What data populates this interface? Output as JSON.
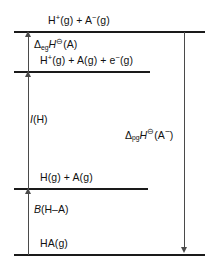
{
  "diagram": {
    "levels": [
      {
        "id": "ion-pair",
        "label_html": "H<sup>+</sup>(g) + A<sup>−</sup>(g)",
        "label_text": "H+(g) + A-(g)"
      },
      {
        "id": "proton-atom-electron",
        "label_html": "H<sup>+</sup>(g) + A(g) + e<sup>−</sup>(g)",
        "label_text": "H+(g) + A(g) + e-(g)"
      },
      {
        "id": "atoms",
        "label_html": "H(g) + A(g)",
        "label_text": "H(g) + A(g)"
      },
      {
        "id": "molecule",
        "label_html": "HA(g)",
        "label_text": "HA(g)"
      }
    ],
    "quantities": [
      {
        "id": "electron-gain-enthalpy",
        "label_html": "<span class=\"delta\">Δ</span><span class=\"sub\">eg</span><span class=\"ital\">H</span><span class=\"sup\">⊖</span>(A)",
        "label_text": "ΔegH⊖(A)",
        "direction": "up"
      },
      {
        "id": "ionisation-enthalpy",
        "label_html": "<span class=\"ital\">I</span>(H)",
        "label_text": "I(H)",
        "direction": "up"
      },
      {
        "id": "bond-enthalpy",
        "label_html": "<span class=\"ital\">B</span>(H–A)",
        "label_text": "B(H–A)",
        "direction": "up"
      },
      {
        "id": "proton-gain-enthalpy",
        "label_html": "<span class=\"delta\">Δ</span><span class=\"sub\">pg</span><span class=\"ital\">H</span><span class=\"sup\">⊖</span>(A<sup>−</sup>)",
        "label_text": "ΔpgH⊖(A−)",
        "direction": "down"
      }
    ],
    "colors": {
      "level_line": "#1a1a1a",
      "arrow": "#4a4a4a",
      "text": "#111111",
      "background": "#ffffff"
    }
  }
}
